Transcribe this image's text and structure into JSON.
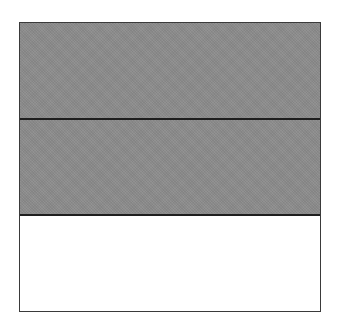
{
  "diagram": {
    "type": "fraction-area-model",
    "total_parts": 3,
    "shaded_parts": 2,
    "orientation": "horizontal-rows",
    "parts": [
      {
        "index": 1,
        "shaded": true
      },
      {
        "index": 2,
        "shaded": true
      },
      {
        "index": 3,
        "shaded": false
      }
    ],
    "colors": {
      "shaded_fill": "#8c8c8c",
      "unshaded_fill": "#ffffff",
      "border": "#3a3a3a"
    }
  }
}
